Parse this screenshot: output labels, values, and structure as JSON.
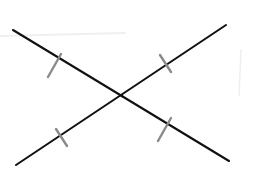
{
  "diagram": {
    "background": "#ffffff",
    "colors": {
      "line": "#111111",
      "tick": "#8a8a8a",
      "smudge": "#eeeeee"
    },
    "intersection": {
      "x": 122,
      "y": 96
    },
    "segments": [
      {
        "id": "descending",
        "x1": 13,
        "y1": 30,
        "x2": 229,
        "y2": 161
      },
      {
        "id": "ascending",
        "x1": 16,
        "y1": 165,
        "x2": 226,
        "y2": 25
      }
    ],
    "tick_marks": [
      {
        "on": "descending",
        "x1": 61,
        "y1": 54,
        "x2": 48,
        "y2": 77
      },
      {
        "on": "descending",
        "x1": 171,
        "y1": 118,
        "x2": 158,
        "y2": 141
      },
      {
        "on": "ascending",
        "x1": 160,
        "y1": 55,
        "x2": 171,
        "y2": 72
      },
      {
        "on": "ascending",
        "x1": 56,
        "y1": 129,
        "x2": 67,
        "y2": 146
      }
    ],
    "artifacts": [
      {
        "type": "smudge",
        "x1": 0,
        "y1": 36,
        "x2": 125,
        "y2": 33
      },
      {
        "type": "faint-stroke",
        "x1": 241,
        "y1": 50,
        "x2": 239,
        "y2": 96
      }
    ]
  }
}
